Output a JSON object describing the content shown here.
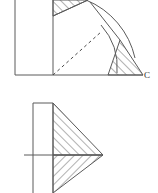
{
  "page": {
    "background_color": "#ffffff",
    "width": 158,
    "height": 193,
    "line_color": "#555555",
    "hatch_color": "#555555",
    "label_color": "#2a2a2a"
  },
  "figures": [
    {
      "id": "top-figure",
      "name": "rotation-sweep-figure",
      "description": "Square with hatched right triangle at top rotated through an arc to a hatched right triangle at bottom right, with dashed radius line and point C",
      "labels": [
        {
          "name": "point-c-label",
          "text": "C",
          "x": 144,
          "y": 75
        }
      ],
      "elements": {
        "outer_square": {
          "left": 15,
          "right": 53,
          "top": 0,
          "bottom": 75
        },
        "base_line": {
          "x1": 15,
          "y1": 75,
          "x2": 143,
          "y2": 75
        },
        "vertical_divider": {
          "x": 53,
          "y1": 0,
          "y2": 75
        },
        "start_triangle": {
          "apex_x": 53,
          "apex_y": 16,
          "top_x": 88,
          "top_y": 0,
          "corner_x": 53,
          "corner_y": 0
        },
        "end_triangle": {
          "base_x1": 108,
          "base_y1": 75,
          "base_x2": 143,
          "base_y2": 75,
          "apex_x": 120,
          "apex_y": 40
        },
        "dashed_radius": {
          "x1": 53,
          "y1": 75,
          "x2": 101,
          "y2": 32
        },
        "arc_inner": {
          "cx": 53,
          "cy": 75,
          "r": 64
        },
        "arc_outer": {
          "cx": 53,
          "cy": 75,
          "r": 82
        }
      }
    },
    {
      "id": "bottom-figure",
      "name": "mirrored-triangles-figure",
      "description": "Square on the left with a horizontal centre line, joined to two hatched right triangles forming an arrowhead pointing right",
      "labels": [],
      "elements": {
        "square": {
          "left": 33,
          "right": 53,
          "top": 103,
          "bottom": 193
        },
        "centre_line": {
          "x1": 24,
          "y1": 155,
          "x2": 103,
          "y2": 155
        },
        "top_edge": {
          "x1": 33,
          "y1": 103,
          "x2": 53,
          "y2": 103
        },
        "upper_triangle": {
          "p1_x": 53,
          "p1_y": 103,
          "p2_x": 103,
          "p2_y": 155,
          "p3_x": 53,
          "p3_y": 155
        },
        "lower_triangle": {
          "p1_x": 53,
          "p1_y": 155,
          "p2_x": 103,
          "p2_y": 155,
          "p3_x": 53,
          "p3_y": 193
        },
        "apex": {
          "x": 103,
          "y": 155
        }
      }
    }
  ]
}
